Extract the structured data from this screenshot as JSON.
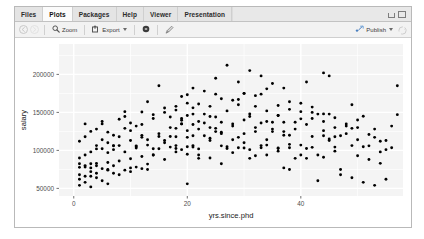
{
  "window": {
    "controls": {
      "minimize": "minimize-icon",
      "maximize": "maximize-icon"
    }
  },
  "tabs": [
    {
      "label": "Files",
      "active": false
    },
    {
      "label": "Plots",
      "active": true
    },
    {
      "label": "Packages",
      "active": false
    },
    {
      "label": "Help",
      "active": false
    },
    {
      "label": "Viewer",
      "active": false
    },
    {
      "label": "Presentation",
      "active": false
    }
  ],
  "toolbar": {
    "back_icon": "back-arrow-icon",
    "forward_icon": "forward-arrow-icon",
    "zoom_label": "Zoom",
    "zoom_icon": "magnifier-icon",
    "export_label": "Export",
    "export_icon": "export-icon",
    "export_caret": "chevron-down-icon",
    "remove_icon": "remove-plot-icon",
    "clear_icon": "clear-all-plots-icon",
    "publish_label": "Publish",
    "publish_icon": "publish-icon",
    "publish_caret": "chevron-down-icon",
    "refresh_icon": "refresh-icon"
  },
  "chart_data": {
    "type": "scatter",
    "title": "",
    "xlabel": "yrs.since.phd",
    "ylabel": "salary",
    "xlim": [
      -2.6,
      58.0
    ],
    "ylim": [
      40000,
      240000
    ],
    "xticks": [
      0,
      20,
      40
    ],
    "yticks": [
      50000,
      100000,
      150000,
      200000
    ],
    "xticklabels": [
      "0",
      "20",
      "40"
    ],
    "yticklabels": [
      "50000",
      "100000",
      "150000",
      "200000"
    ],
    "grid": true,
    "grid_color": "#ffffff",
    "panel_background": "#ebebeb",
    "point_color": "#000000",
    "point_size": 2.0,
    "legend": null,
    "points": [
      [
        19,
        139750
      ],
      [
        20,
        173200
      ],
      [
        4,
        79750
      ],
      [
        45,
        115000
      ],
      [
        40,
        141500
      ],
      [
        6,
        97000
      ],
      [
        30,
        175000
      ],
      [
        45,
        147765
      ],
      [
        21,
        119250
      ],
      [
        18,
        129000
      ],
      [
        12,
        119800
      ],
      [
        7,
        79800
      ],
      [
        1,
        77700
      ],
      [
        2,
        78000
      ],
      [
        20,
        104800
      ],
      [
        12,
        117150
      ],
      [
        19,
        101000
      ],
      [
        38,
        103450
      ],
      [
        37,
        124750
      ],
      [
        39,
        137000
      ],
      [
        31,
        89565
      ],
      [
        36,
        102580
      ],
      [
        34,
        93904
      ],
      [
        24,
        113068
      ],
      [
        38,
        74830
      ],
      [
        21,
        106294
      ],
      [
        19,
        134885
      ],
      [
        26,
        82379
      ],
      [
        37,
        77000
      ],
      [
        15,
        102234
      ],
      [
        33,
        106300
      ],
      [
        31,
        144651
      ],
      [
        36,
        103106
      ],
      [
        40,
        107008
      ],
      [
        17,
        118223
      ],
      [
        21,
        104332
      ],
      [
        28,
        134885
      ],
      [
        23,
        147765
      ],
      [
        44,
        119250
      ],
      [
        9,
        129000
      ],
      [
        11,
        104800
      ],
      [
        20,
        117150
      ],
      [
        7,
        101000
      ],
      [
        29,
        103450
      ],
      [
        25,
        124750
      ],
      [
        35,
        137000
      ],
      [
        41,
        89565
      ],
      [
        27,
        102580
      ],
      [
        22,
        93904
      ],
      [
        16,
        113068
      ],
      [
        13,
        74830
      ],
      [
        8,
        106294
      ],
      [
        5,
        134885
      ],
      [
        3,
        82379
      ],
      [
        10,
        77000
      ],
      [
        14,
        102234
      ],
      [
        18,
        106300
      ],
      [
        24,
        144651
      ],
      [
        30,
        103106
      ],
      [
        34,
        107008
      ],
      [
        42,
        118223
      ],
      [
        46,
        104332
      ],
      [
        48,
        134885
      ],
      [
        43,
        147765
      ],
      [
        47,
        119250
      ],
      [
        49,
        129000
      ],
      [
        51,
        104800
      ],
      [
        53,
        117150
      ],
      [
        55,
        101000
      ],
      [
        56,
        103450
      ],
      [
        32,
        124750
      ],
      [
        26,
        137000
      ],
      [
        22,
        89565
      ],
      [
        18,
        102580
      ],
      [
        14,
        93904
      ],
      [
        10,
        113068
      ],
      [
        6,
        74830
      ],
      [
        4,
        106294
      ],
      [
        2,
        134885
      ],
      [
        1,
        82379
      ],
      [
        3,
        77000
      ],
      [
        5,
        102234
      ],
      [
        7,
        106300
      ],
      [
        9,
        144651
      ],
      [
        11,
        103106
      ],
      [
        13,
        107008
      ],
      [
        15,
        118223
      ],
      [
        17,
        104332
      ],
      [
        19,
        134885
      ],
      [
        21,
        147765
      ],
      [
        23,
        119250
      ],
      [
        25,
        129000
      ],
      [
        27,
        104800
      ],
      [
        29,
        117150
      ],
      [
        31,
        101000
      ],
      [
        33,
        103450
      ],
      [
        35,
        124750
      ],
      [
        37,
        137000
      ],
      [
        39,
        89565
      ],
      [
        41,
        102580
      ],
      [
        43,
        93904
      ],
      [
        45,
        113068
      ],
      [
        47,
        74830
      ],
      [
        49,
        106294
      ],
      [
        12,
        150500
      ],
      [
        16,
        155750
      ],
      [
        20,
        162200
      ],
      [
        24,
        158000
      ],
      [
        28,
        166000
      ],
      [
        32,
        172000
      ],
      [
        36,
        159000
      ],
      [
        40,
        151000
      ],
      [
        44,
        148000
      ],
      [
        8,
        141000
      ],
      [
        4,
        128000
      ],
      [
        2,
        118000
      ],
      [
        6,
        124000
      ],
      [
        10,
        136000
      ],
      [
        14,
        147000
      ],
      [
        18,
        153000
      ],
      [
        22,
        161000
      ],
      [
        26,
        168000
      ],
      [
        30,
        175000
      ],
      [
        34,
        181000
      ],
      [
        38,
        164000
      ],
      [
        42,
        157000
      ],
      [
        46,
        143000
      ],
      [
        50,
        130000
      ],
      [
        52,
        121000
      ],
      [
        54,
        112000
      ],
      [
        15,
        185000
      ],
      [
        25,
        195000
      ],
      [
        31,
        205000
      ],
      [
        27,
        212000
      ],
      [
        35,
        188000
      ],
      [
        23,
        178000
      ],
      [
        19,
        171000
      ],
      [
        13,
        164000
      ],
      [
        9,
        151000
      ],
      [
        5,
        138000
      ],
      [
        3,
        125000
      ],
      [
        1,
        112000
      ],
      [
        7,
        120000
      ],
      [
        11,
        132000
      ],
      [
        17,
        144000
      ],
      [
        21,
        156000
      ],
      [
        29,
        167000
      ],
      [
        33,
        174000
      ],
      [
        37,
        182000
      ],
      [
        41,
        190000
      ],
      [
        45,
        198000
      ],
      [
        49,
        160000
      ],
      [
        51,
        145000
      ],
      [
        53,
        128000
      ],
      [
        55,
        113000
      ],
      [
        57,
        185000
      ],
      [
        12,
        92000
      ],
      [
        16,
        88000
      ],
      [
        20,
        95000
      ],
      [
        24,
        90000
      ],
      [
        28,
        97000
      ],
      [
        32,
        93000
      ],
      [
        36,
        99000
      ],
      [
        40,
        94000
      ],
      [
        44,
        91000
      ],
      [
        8,
        86000
      ],
      [
        4,
        83000
      ],
      [
        2,
        80000
      ],
      [
        6,
        84000
      ],
      [
        10,
        89000
      ],
      [
        14,
        94000
      ],
      [
        18,
        98000
      ],
      [
        22,
        102000
      ],
      [
        26,
        106000
      ],
      [
        30,
        110000
      ],
      [
        34,
        114000
      ],
      [
        38,
        108000
      ],
      [
        42,
        104000
      ],
      [
        46,
        99000
      ],
      [
        50,
        93000
      ],
      [
        52,
        88000
      ],
      [
        54,
        83000
      ],
      [
        1,
        68000
      ],
      [
        3,
        72000
      ],
      [
        5,
        76000
      ],
      [
        7,
        70000
      ],
      [
        9,
        74000
      ],
      [
        11,
        78000
      ],
      [
        13,
        82000
      ],
      [
        2,
        66000
      ],
      [
        4,
        70000
      ],
      [
        6,
        74000
      ],
      [
        8,
        68000
      ],
      [
        10,
        72000
      ],
      [
        12,
        76000
      ],
      [
        1,
        62000
      ],
      [
        3,
        66000
      ],
      [
        5,
        60000
      ],
      [
        2,
        58000
      ],
      [
        4,
        64000
      ],
      [
        6,
        56000
      ],
      [
        1,
        54000
      ],
      [
        3,
        52000
      ],
      [
        20,
        56000
      ],
      [
        43,
        60000
      ],
      [
        47,
        68000
      ],
      [
        49,
        64000
      ],
      [
        51,
        58000
      ],
      [
        53,
        54000
      ],
      [
        55,
        62000
      ],
      [
        38,
        120000
      ],
      [
        39,
        128000
      ],
      [
        41,
        134000
      ],
      [
        42,
        142000
      ],
      [
        44,
        126000
      ],
      [
        46,
        118000
      ],
      [
        48,
        132000
      ],
      [
        50,
        140000
      ],
      [
        36,
        146000
      ],
      [
        34,
        152000
      ],
      [
        32,
        158000
      ],
      [
        30,
        140000
      ],
      [
        28,
        132000
      ],
      [
        26,
        124000
      ],
      [
        24,
        116000
      ],
      [
        22,
        128000
      ],
      [
        23,
        136000
      ],
      [
        25,
        144000
      ],
      [
        27,
        152000
      ],
      [
        29,
        160000
      ],
      [
        31,
        148000
      ],
      [
        33,
        136000
      ],
      [
        35,
        128000
      ],
      [
        37,
        120000
      ],
      [
        16,
        110000
      ],
      [
        18,
        118000
      ],
      [
        20,
        126000
      ],
      [
        21,
        134000
      ],
      [
        19,
        142000
      ],
      [
        17,
        130000
      ],
      [
        15,
        122000
      ],
      [
        13,
        114000
      ],
      [
        11,
        106000
      ],
      [
        9,
        98000
      ],
      [
        7,
        106000
      ],
      [
        5,
        114000
      ],
      [
        3,
        98000
      ],
      [
        1,
        90000
      ],
      [
        2,
        94000
      ],
      [
        4,
        102000
      ],
      [
        6,
        110000
      ],
      [
        8,
        118000
      ],
      [
        10,
        126000
      ],
      [
        12,
        134000
      ],
      [
        14,
        142000
      ],
      [
        16,
        150000
      ],
      [
        18,
        158000
      ],
      [
        20,
        146000
      ],
      [
        22,
        138000
      ],
      [
        24,
        130000
      ],
      [
        26,
        122000
      ],
      [
        28,
        114000
      ],
      [
        30,
        122000
      ],
      [
        32,
        130000
      ],
      [
        34,
        138000
      ],
      [
        36,
        146000
      ],
      [
        38,
        154000
      ],
      [
        40,
        162000
      ],
      [
        42,
        150000
      ],
      [
        44,
        138000
      ],
      [
        46,
        130000
      ],
      [
        48,
        122000
      ],
      [
        50,
        114000
      ],
      [
        52,
        106000
      ],
      [
        54,
        98000
      ],
      [
        56,
        132000
      ],
      [
        57,
        147000
      ],
      [
        44,
        202000
      ],
      [
        33,
        198000
      ],
      [
        29,
        190000
      ],
      [
        21,
        182000
      ],
      [
        25,
        174000
      ]
    ]
  }
}
